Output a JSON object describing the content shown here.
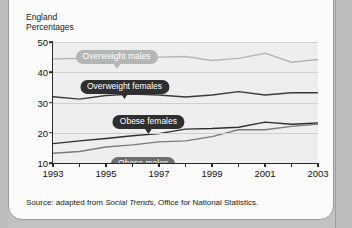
{
  "caption": {
    "region": "England",
    "units": "Percentages",
    "text": "England\nPercentages"
  },
  "source": {
    "prefix": "Source: adapted from ",
    "publication": "Social Trends",
    "suffix": ", Office for National Statistics."
  },
  "colors": {
    "overweight_males": "#b5b5b5",
    "overweight_females": "#3a3a3a",
    "obese_females": "#2f2f2f",
    "obese_males": "#7b7b7b",
    "plot_background": "#eeeeee",
    "gridline": "#cfcfcf",
    "axis": "#2a2a2a",
    "panel": "#fbfbfb",
    "page": "#c2c2c2"
  },
  "callouts": [
    {
      "label": "Overweight males",
      "style": "light",
      "x_year": 1995.4,
      "y_value": 49.0
    },
    {
      "label": "Overweight females",
      "style": "dark",
      "x_year": 1995.7,
      "y_value": 39.0
    },
    {
      "label": "Obese females",
      "style": "dark",
      "x_year": 1996.6,
      "y_value": 27.6
    },
    {
      "label": "Obese males",
      "style": "mid",
      "x_year": 1996.4,
      "y_value": 13.6
    }
  ],
  "chart_data": {
    "type": "line",
    "title": "England",
    "subtitle": "Percentages",
    "xlabel": "",
    "ylabel": "Percentages",
    "xlim": [
      1993,
      2003
    ],
    "ylim": [
      10,
      50
    ],
    "yticks": [
      10,
      20,
      30,
      40,
      50
    ],
    "ytick_labels": [
      "10",
      "20",
      "30",
      "40",
      "50"
    ],
    "xticks": [
      1993,
      1994,
      1995,
      1996,
      1997,
      1998,
      1999,
      2000,
      2001,
      2002,
      2003
    ],
    "xtick_labels_major": [
      "1993",
      "1995",
      "1997",
      "1999",
      "2001",
      "2003"
    ],
    "xticks_major": [
      1993,
      1995,
      1997,
      1999,
      2001,
      2003
    ],
    "grid": true,
    "legend_position": "inline-callouts",
    "x": [
      1993,
      1994,
      1995,
      1996,
      1997,
      1998,
      1999,
      2000,
      2001,
      2002,
      2003
    ],
    "series": [
      {
        "name": "Overweight males",
        "color": "#b5b5b5",
        "values": [
          44.4,
          44.6,
          44.1,
          44.4,
          45.0,
          45.2,
          43.9,
          44.6,
          46.3,
          43.3,
          44.2
        ]
      },
      {
        "name": "Overweight females",
        "color": "#3a3a3a",
        "values": [
          31.9,
          31.1,
          32.3,
          32.8,
          32.5,
          31.8,
          32.5,
          33.6,
          32.5,
          33.2,
          33.2
        ]
      },
      {
        "name": "Obese females",
        "color": "#2f2f2f",
        "values": [
          16.4,
          17.3,
          18.1,
          19.0,
          19.7,
          21.2,
          21.4,
          21.8,
          23.5,
          22.8,
          23.2
        ]
      },
      {
        "name": "Obese males",
        "color": "#7b7b7b",
        "values": [
          13.2,
          13.8,
          15.3,
          16.0,
          17.0,
          17.3,
          18.7,
          21.0,
          21.0,
          22.1,
          22.9
        ]
      }
    ]
  }
}
